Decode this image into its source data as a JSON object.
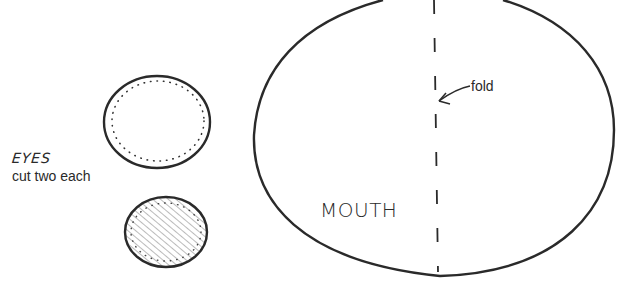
{
  "diagram": {
    "eyes": {
      "title": "EYES",
      "instruction": "cut two each",
      "shapes": [
        {
          "name": "outer-eye-circle",
          "style": "outline with dotted inner stitching line"
        },
        {
          "name": "pupil-circle",
          "style": "outline with diagonal hatching fill"
        }
      ]
    },
    "mouth": {
      "label": "MOUTH",
      "fold": {
        "label": "fold",
        "line_style": "dashed vertical"
      }
    },
    "colors": {
      "stroke": "#2a2a2a",
      "background": "#ffffff",
      "hatch": "#6a6a6a"
    }
  }
}
